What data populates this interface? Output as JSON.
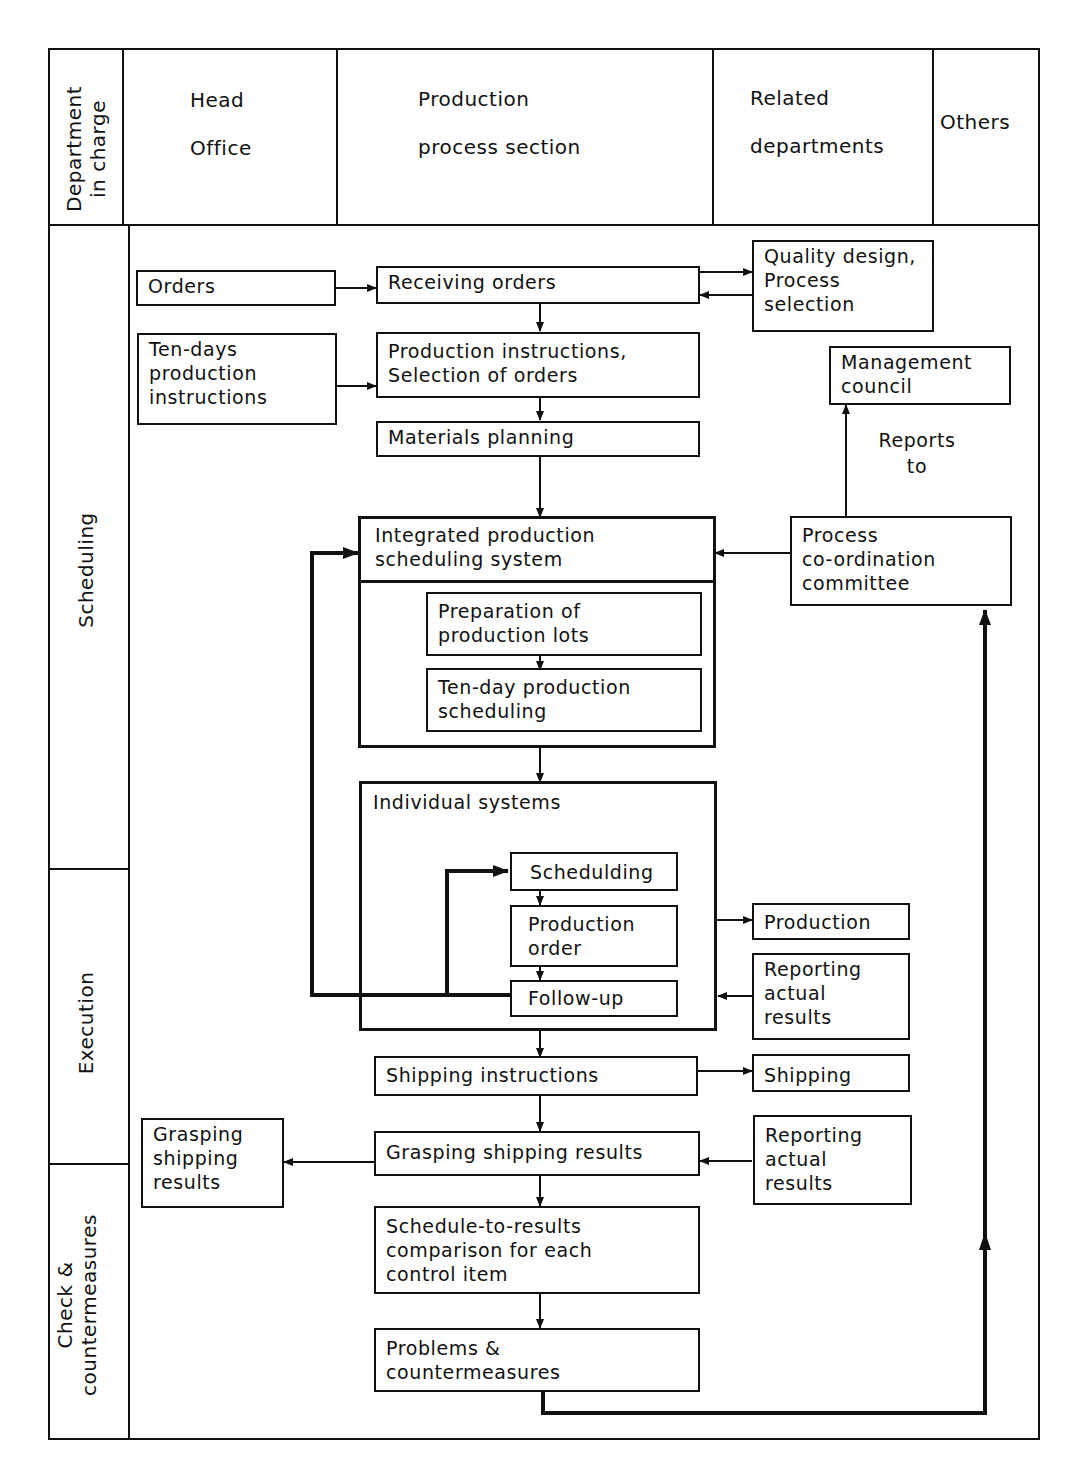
{
  "header": {
    "corner_label": "Department\nin charge",
    "columns": [
      {
        "id": "head-office",
        "label": "Head\nOffice"
      },
      {
        "id": "production-process-section",
        "label": "Production\nprocess  section"
      },
      {
        "id": "related-departments",
        "label": "Related\ndepartments"
      },
      {
        "id": "others",
        "label": "Others"
      }
    ]
  },
  "rows": [
    {
      "id": "scheduling",
      "label": "Scheduling"
    },
    {
      "id": "execution",
      "label": "Execution"
    },
    {
      "id": "check-countermeasures",
      "label": "Check  &\ncountermeasures"
    }
  ],
  "nodes": {
    "orders": "Orders",
    "receiving_orders": "Receiving  orders",
    "quality_design": "Quality design,\nProcess\nselection",
    "ten_days_instructions": "Ten-days\nproduction\ninstructions",
    "production_instructions": "Production  instructions,\nSelection  of  orders",
    "management_council": "Management\ncouncil",
    "reports_to": "Reports\nto",
    "materials_planning": "Materials  planning",
    "integrated_system": "Integrated  production\nscheduling  system",
    "process_committee": "Process\nco-ordination\ncommittee",
    "preparation_lots": "Preparation  of\nproduction  lots",
    "ten_day_scheduling": "Ten-day  production\nscheduling",
    "individual_systems": "Individual   systems",
    "schedulding": "Schedulding",
    "production_order": "Production\norder",
    "follow_up": "Follow-up",
    "production": "Production",
    "reporting_actual_1": "Reporting\nactual\nresults",
    "shipping_instructions": "Shipping  instructions",
    "shipping": "Shipping",
    "grasping_head": "Grasping\nshipping\nresults",
    "grasping_results": "Grasping  shipping  results",
    "reporting_actual_2": "Reporting\nactual\nresults",
    "schedule_comparison": "Schedule-to-results\ncomparison  for  each\ncontrol  item",
    "problems": "Problems   &\ncountermeasures"
  },
  "edges": [
    {
      "from": "orders",
      "to": "receiving_orders"
    },
    {
      "from": "receiving_orders",
      "to": "quality_design"
    },
    {
      "from": "quality_design",
      "to": "receiving_orders"
    },
    {
      "from": "receiving_orders",
      "to": "production_instructions"
    },
    {
      "from": "ten_days_instructions",
      "to": "production_instructions"
    },
    {
      "from": "production_instructions",
      "to": "materials_planning"
    },
    {
      "from": "materials_planning",
      "to": "integrated_system"
    },
    {
      "from": "process_committee",
      "to": "management_council",
      "label": "Reports to"
    },
    {
      "from": "process_committee",
      "to": "integrated_system"
    },
    {
      "from": "preparation_lots",
      "to": "ten_day_scheduling"
    },
    {
      "from": "integrated_system",
      "to": "individual_systems"
    },
    {
      "from": "schedulding",
      "to": "production_order"
    },
    {
      "from": "production_order",
      "to": "follow_up"
    },
    {
      "from": "follow_up",
      "to": "schedulding"
    },
    {
      "from": "follow_up",
      "to": "integrated_system"
    },
    {
      "from": "individual_systems",
      "to": "production"
    },
    {
      "from": "reporting_actual_1",
      "to": "individual_systems"
    },
    {
      "from": "individual_systems",
      "to": "shipping_instructions"
    },
    {
      "from": "shipping_instructions",
      "to": "shipping"
    },
    {
      "from": "shipping_instructions",
      "to": "grasping_results"
    },
    {
      "from": "grasping_results",
      "to": "grasping_head"
    },
    {
      "from": "reporting_actual_2",
      "to": "grasping_results"
    },
    {
      "from": "grasping_results",
      "to": "schedule_comparison"
    },
    {
      "from": "schedule_comparison",
      "to": "problems"
    },
    {
      "from": "problems",
      "to": "process_committee"
    }
  ],
  "colors": {
    "line": "#111111",
    "background": "#ffffff"
  }
}
